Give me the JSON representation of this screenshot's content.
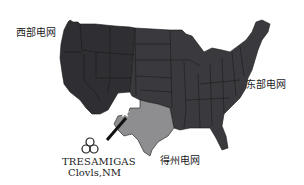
{
  "map": {
    "title": "US power grid interconnections",
    "regions": [
      {
        "id": "western",
        "label": "西部电网",
        "color": "#2f2f33"
      },
      {
        "id": "eastern",
        "label": "东部电网",
        "color": "#3a3a3e"
      },
      {
        "id": "texas",
        "label": "得州电网",
        "color": "#8e8e90"
      }
    ],
    "marker": {
      "company": "TRESAMIGAS",
      "location": "Clovls,NM",
      "icon": "star-icon",
      "color": "#ffffff"
    },
    "colors": {
      "background": "#ffffff",
      "state_border": "#1a1a1a",
      "arrow": "#111111"
    }
  }
}
